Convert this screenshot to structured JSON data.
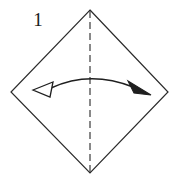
{
  "figure": {
    "kind": "origami-fold-diagram",
    "step_number": "1",
    "background_color": "#ffffff",
    "line_color": "#2b2b2b",
    "arrow_color": "#1f1f1f",
    "fold_line_color": "#3a3a3a",
    "canvas": {
      "width": 180,
      "height": 182
    },
    "shape": {
      "name": "square-rotated-45",
      "label": "diamond",
      "vertices": {
        "top": {
          "x": 90,
          "y": 10
        },
        "right": {
          "x": 168,
          "y": 92
        },
        "bottom": {
          "x": 90,
          "y": 173
        },
        "left": {
          "x": 11,
          "y": 92
        }
      },
      "stroke_width": 1.2
    },
    "fold_line": {
      "name": "vertical-fold-crease",
      "style": "dashed",
      "dash_length": 7,
      "dash_gap": 4,
      "stroke_width": 1.2,
      "from": {
        "x": 90,
        "y": 11
      },
      "to": {
        "x": 90,
        "y": 172
      }
    },
    "arrow": {
      "name": "double-headed-fold-arrow",
      "style": "curved-arc",
      "stroke_width": 1.4,
      "arc": {
        "start": {
          "x": 51,
          "y": 88
        },
        "control": {
          "x": 90,
          "y": 70
        },
        "end": {
          "x": 133,
          "y": 87
        }
      },
      "left_head": {
        "name": "open-arrowhead",
        "fill": "#ffffff",
        "stroke": "#1f1f1f",
        "tip": {
          "x": 33,
          "y": 90
        },
        "wing_a": {
          "x": 53,
          "y": 82
        },
        "wing_b": {
          "x": 50,
          "y": 97
        }
      },
      "right_head": {
        "name": "solid-arrowhead",
        "fill": "#1f1f1f",
        "stroke": "#1f1f1f",
        "tip": {
          "x": 151,
          "y": 95
        },
        "wing_a": {
          "x": 128,
          "y": 81
        },
        "wing_b": {
          "x": 134,
          "y": 93
        }
      }
    }
  }
}
